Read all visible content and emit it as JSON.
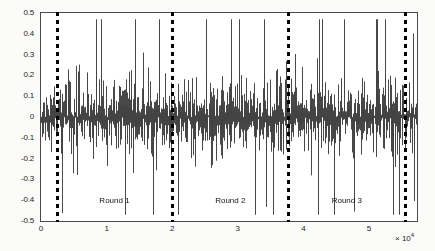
{
  "chart_data": {
    "type": "line",
    "title": "",
    "subtitle": "",
    "xlabel": "",
    "ylabel": "",
    "x_exponent_label": "× 10",
    "x_exponent_power": "4",
    "xlim": [
      0,
      57300
    ],
    "ylim": [
      -0.5,
      0.5
    ],
    "grid": false,
    "legend": null,
    "x_tick_labels": [
      "0",
      "1",
      "2",
      "3",
      "4",
      "5"
    ],
    "x_tick_values": [
      0,
      10000,
      20000,
      30000,
      40000,
      50000
    ],
    "y_tick_labels": [
      "0.5",
      "0.4",
      "0.3",
      "0.2",
      "0.1",
      "0",
      "-0.1",
      "-0.2",
      "-0.3",
      "-0.4",
      "-0.5"
    ],
    "y_tick_values": [
      0.5,
      0.4,
      0.3,
      0.2,
      0.1,
      0,
      -0.1,
      -0.2,
      -0.3,
      -0.4,
      -0.5
    ],
    "series": [
      {
        "name": "signal",
        "color": "#3a3a3a",
        "description": "dense broadband noise waveform, zero-mean",
        "envelope_core": 0.22,
        "envelope_peak": 0.47
      }
    ],
    "annotations": [
      {
        "type": "vline",
        "name": "round-divider-1",
        "x": 2400,
        "style": "dashed",
        "color": "#000000"
      },
      {
        "type": "vline",
        "name": "round-divider-2",
        "x": 20000,
        "style": "dashed",
        "color": "#000000"
      },
      {
        "type": "vline",
        "name": "round-divider-3",
        "x": 37700,
        "style": "dashed",
        "color": "#000000"
      },
      {
        "type": "vline",
        "name": "round-divider-4",
        "x": 55500,
        "style": "dashed",
        "color": "#000000"
      }
    ],
    "region_labels": [
      {
        "label": "Round 1",
        "x_center": 11200,
        "y": -0.38
      },
      {
        "label": "Round 2",
        "x_center": 28850,
        "y": -0.38
      },
      {
        "label": "Round 3",
        "x_center": 46600,
        "y": -0.38
      }
    ]
  }
}
